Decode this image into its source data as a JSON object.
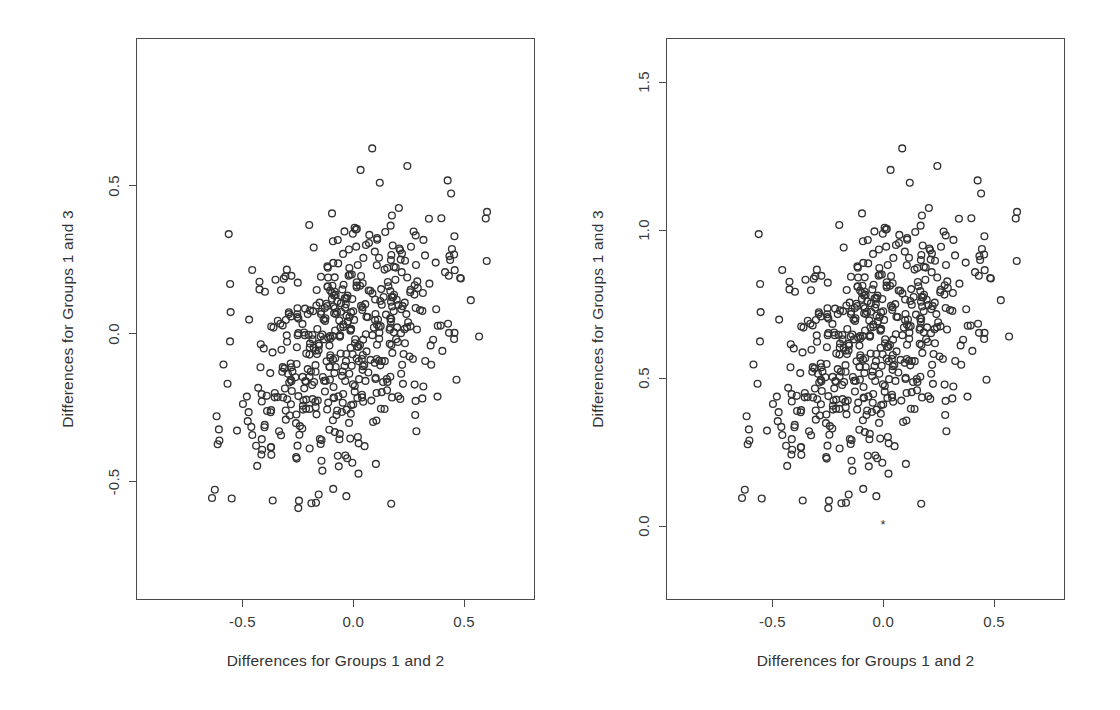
{
  "figure": {
    "width": 1120,
    "height": 710,
    "background": "#ffffff",
    "point_color": "#333333",
    "axis_color": "#4a4a4a",
    "text_color": "#333333"
  },
  "chart_data": [
    {
      "type": "scatter",
      "panel": "left",
      "title": "",
      "xlabel": "Differences for Groups 1 and 2",
      "ylabel": "Differences for Groups 1 and 3",
      "xlim": [
        -0.98,
        0.82
      ],
      "ylim": [
        -0.9,
        1.0
      ],
      "xticks": [
        -0.5,
        0.0,
        0.5
      ],
      "xticklabels": [
        "-0.5",
        "0.0",
        "0.5"
      ],
      "yticks": [
        -0.5,
        0.0,
        0.5
      ],
      "yticklabels": [
        "-0.5",
        "0.0",
        "0.5"
      ],
      "grid": false,
      "legend": false,
      "marker": "open-circle",
      "n_points": 520,
      "y_offset": 0.0,
      "box": {
        "left": 136,
        "top": 38,
        "right": 535,
        "bottom": 600
      }
    },
    {
      "type": "scatter",
      "panel": "right",
      "title": "",
      "xlabel": "Differences for Groups 1 and 2",
      "ylabel": "Differences for Groups 1 and 3",
      "xlim": [
        -0.98,
        0.82
      ],
      "ylim": [
        -0.25,
        1.65
      ],
      "xticks": [
        -0.5,
        0.0,
        0.5
      ],
      "xticklabels": [
        "-0.5",
        "0.0",
        "0.5"
      ],
      "yticks": [
        0.0,
        0.5,
        1.0,
        1.5
      ],
      "yticklabels": [
        "0.0",
        "0.5",
        "1.0",
        "1.5"
      ],
      "grid": false,
      "legend": false,
      "marker": "open-circle",
      "n_points": 520,
      "y_offset": 0.65,
      "box": {
        "left": 666,
        "top": 38,
        "right": 1065,
        "bottom": 600
      },
      "annotation": {
        "symbol": "*",
        "x": 0.0,
        "y": 0.0
      }
    }
  ],
  "scatter": {
    "seed": 20240517,
    "n": 520,
    "mean_x": -0.02,
    "mean_y": -0.035,
    "sd_x": 0.245,
    "sd_y": 0.225,
    "correlation": 0.46,
    "description": "Correlated bivariate cloud of paired group differences"
  }
}
